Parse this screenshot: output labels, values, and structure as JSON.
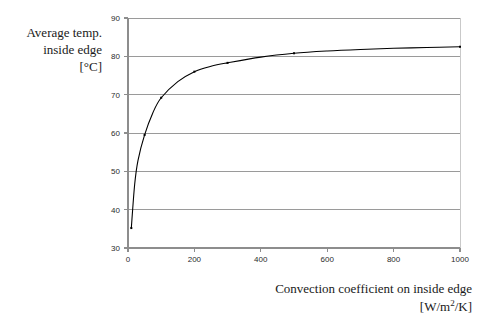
{
  "chart_data": {
    "type": "line",
    "title": "",
    "xlabel": "Convection coefficient on inside edge",
    "xlabel_units": "[W/m2/K]",
    "ylabel": "Average temp. inside edge",
    "ylabel_units": "[°C]",
    "ylabel_line1": "Average temp.",
    "ylabel_line2": "inside edge",
    "ylabel_line3": "[°C]",
    "xlim": [
      0,
      1000
    ],
    "ylim": [
      30,
      90
    ],
    "xticks": [
      0,
      200,
      400,
      600,
      800,
      1000
    ],
    "yticks": [
      30,
      40,
      50,
      60,
      70,
      80,
      90
    ],
    "xtick_labels": [
      "0",
      "200",
      "400",
      "600",
      "800",
      "1000"
    ],
    "ytick_labels": [
      "30",
      "40",
      "50",
      "60",
      "70",
      "80",
      "90"
    ],
    "grid": "horizontal",
    "legend": "none",
    "series": [
      {
        "name": "Average temp. inside edge",
        "marker": "small-dot",
        "color": "#000000",
        "x": [
          10,
          20,
          30,
          50,
          75,
          100,
          150,
          200,
          250,
          300,
          400,
          500,
          600,
          700,
          800,
          900,
          1000
        ],
        "y": [
          35.2,
          46.5,
          52.8,
          59.5,
          65.3,
          69.2,
          73.4,
          76.0,
          77.4,
          78.3,
          79.8,
          80.8,
          81.4,
          81.8,
          82.1,
          82.3,
          82.5
        ]
      }
    ],
    "marked_points": {
      "x": [
        10,
        50,
        100,
        200,
        300,
        500,
        1000
      ],
      "y": [
        35.2,
        59.5,
        69.2,
        76.0,
        78.3,
        80.8,
        82.5
      ]
    },
    "colors": {
      "curve": "#000000",
      "grid": "#9a9a9a",
      "axis": "#8d8d8d",
      "background": "#ffffff",
      "text": "#1a1a1a"
    }
  }
}
